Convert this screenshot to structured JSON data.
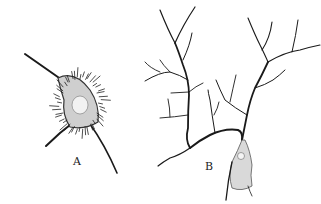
{
  "figure": {
    "panels": [
      {
        "id": "A",
        "label": "A",
        "description": "spider-like cell body with many short spiny processes and two long fibers"
      },
      {
        "id": "B",
        "label": "B",
        "description": "branching cell with long tree-like dendritic processes and stippled cell body with nucleus"
      }
    ],
    "colors": {
      "ink": "#1a1a1a",
      "background": "#ffffff",
      "stipple": "#777777"
    }
  }
}
